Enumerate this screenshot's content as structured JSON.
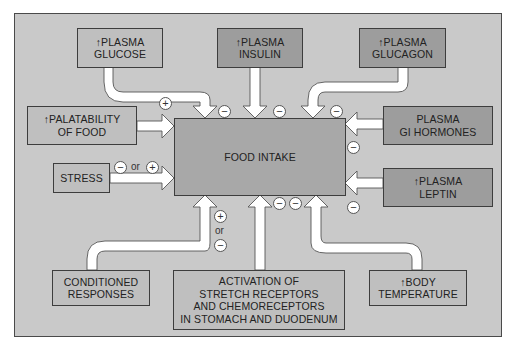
{
  "diagram": {
    "center": {
      "label": "FOOD INTAKE"
    },
    "inputs": [
      {
        "id": "plasma-glucose",
        "label": "↑PLASMA\nGLUCOSE",
        "shade": "light",
        "effect": "−"
      },
      {
        "id": "plasma-insulin",
        "label": "↑PLASMA\nINSULIN",
        "shade": "dark",
        "effect": "−"
      },
      {
        "id": "plasma-glucagon",
        "label": "↑PLASMA\nGLUCAGON",
        "shade": "dark",
        "effect": "−"
      },
      {
        "id": "palatability",
        "label": "↑PALATABILITY\nOF FOOD",
        "shade": "light",
        "effect": "+"
      },
      {
        "id": "plasma-gi-hormones",
        "label": "PLASMA\nGI HORMONES",
        "shade": "dark",
        "effect": "−"
      },
      {
        "id": "stress",
        "label": "STRESS",
        "shade": "light",
        "effect": "− or +"
      },
      {
        "id": "plasma-leptin",
        "label": "↑PLASMA\nLEPTIN",
        "shade": "dark",
        "effect": "−"
      },
      {
        "id": "conditioned-responses",
        "label": "CONDITIONED\nRESPONSES",
        "shade": "light",
        "effect": "+ or −"
      },
      {
        "id": "stretch-receptors",
        "label": "ACTIVATION  OF\nSTRETCH RECEPTORS\nAND CHEMORECEPTORS\nIN STOMACH AND DUODENUM",
        "shade": "light",
        "effect": "−"
      },
      {
        "id": "body-temperature",
        "label": "↑BODY\nTEMPERATURE",
        "shade": "light",
        "effect": "−"
      }
    ],
    "signs": {
      "minus": "−",
      "plus": "+",
      "or": "or"
    },
    "colors": {
      "panel": "#c9c9c9",
      "light_box": "#bfbfbf",
      "dark_box": "#9d9d9d",
      "center_box": "#a8a8a8",
      "arrow": "#ffffff",
      "border": "#3d3d3d"
    }
  }
}
